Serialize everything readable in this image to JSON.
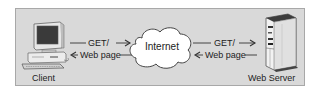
{
  "diagram": {
    "nodes": {
      "client": {
        "label": "Client",
        "icon": "desktop-computer-icon"
      },
      "internet": {
        "label": "Internet",
        "icon": "cloud-icon"
      },
      "server": {
        "label": "Web Server",
        "icon": "server-tower-icon"
      }
    },
    "edges": {
      "client_to_internet": {
        "request": "GET/",
        "response": "Web page"
      },
      "internet_to_server": {
        "request": "GET/",
        "response": "Web page"
      }
    },
    "colors": {
      "panel": "#d9d9d9",
      "panel_border": "#a8a8a8",
      "line": "#333333",
      "cloud_fill": "#ffffff"
    }
  }
}
